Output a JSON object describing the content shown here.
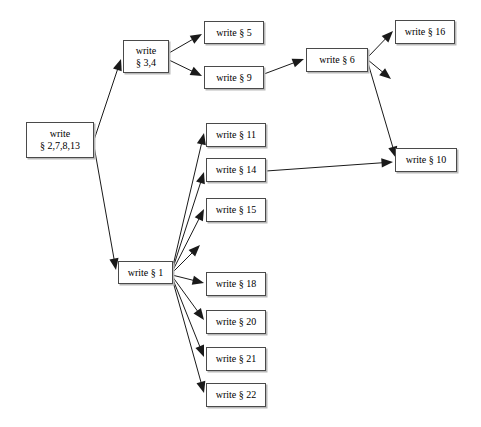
{
  "diagram": {
    "type": "directed-graph",
    "background_color": "#ffffff",
    "node_fill": "#ffffff",
    "node_border_color": "#4a4a4a",
    "node_shadow_color": "#b9b9b9",
    "edge_color": "#1a1a1a",
    "text_color": "#000000",
    "nodes": [
      {
        "id": "n_2_7_8_13",
        "lines": [
          "write",
          "§ 2,7,8,13"
        ],
        "label": "write § 2,7,8,13",
        "x": 26,
        "y": 122,
        "w": 68,
        "h": 36
      },
      {
        "id": "n_3_4",
        "lines": [
          "write",
          "§ 3,4"
        ],
        "label": "write § 3,4",
        "x": 123,
        "y": 40,
        "w": 46,
        "h": 33
      },
      {
        "id": "n_5",
        "lines": [
          "write § 5"
        ],
        "label": "write § 5",
        "x": 204,
        "y": 21,
        "w": 60,
        "h": 23
      },
      {
        "id": "n_9",
        "lines": [
          "write § 9"
        ],
        "label": "write § 9",
        "x": 204,
        "y": 66,
        "w": 60,
        "h": 23
      },
      {
        "id": "n_6",
        "lines": [
          "write § 6"
        ],
        "label": "write § 6",
        "x": 306,
        "y": 48,
        "w": 62,
        "h": 24
      },
      {
        "id": "n_16",
        "lines": [
          "write § 16"
        ],
        "label": "write § 16",
        "x": 395,
        "y": 20,
        "w": 60,
        "h": 24
      },
      {
        "id": "n_10",
        "lines": [
          "write § 10"
        ],
        "label": "write § 10",
        "x": 395,
        "y": 148,
        "w": 62,
        "h": 24
      },
      {
        "id": "n_11",
        "lines": [
          "write § 11"
        ],
        "label": "write § 11",
        "x": 206,
        "y": 123,
        "w": 60,
        "h": 24
      },
      {
        "id": "n_14",
        "lines": [
          "write § 14"
        ],
        "label": "write § 14",
        "x": 206,
        "y": 158,
        "w": 60,
        "h": 24
      },
      {
        "id": "n_15",
        "lines": [
          "write § 15"
        ],
        "label": "write § 15",
        "x": 206,
        "y": 198,
        "w": 60,
        "h": 24
      },
      {
        "id": "n_hub",
        "lines": [
          "write § 1"
        ],
        "label": "write § 1",
        "x": 118,
        "y": 261,
        "w": 55,
        "h": 23
      },
      {
        "id": "n_18",
        "lines": [
          "write § 18"
        ],
        "label": "write § 18",
        "x": 206,
        "y": 272,
        "w": 60,
        "h": 24
      },
      {
        "id": "n_20",
        "lines": [
          "write § 20"
        ],
        "label": "write § 20",
        "x": 206,
        "y": 310,
        "w": 60,
        "h": 24
      },
      {
        "id": "n_21",
        "lines": [
          "write § 21"
        ],
        "label": "write § 21",
        "x": 206,
        "y": 347,
        "w": 60,
        "h": 24
      },
      {
        "id": "n_22",
        "lines": [
          "write § 22"
        ],
        "label": "write § 22",
        "x": 206,
        "y": 383,
        "w": 60,
        "h": 24
      }
    ],
    "edges": [
      {
        "from": "n_2_7_8_13",
        "to": "n_3_4",
        "x1": 94,
        "y1": 140,
        "x2": 121,
        "y2": 59
      },
      {
        "from": "n_2_7_8_13",
        "to": "n_hub",
        "x1": 94,
        "y1": 146,
        "x2": 116,
        "y2": 270
      },
      {
        "from": "n_3_4",
        "to": "n_5",
        "x1": 169,
        "y1": 53,
        "x2": 202,
        "y2": 34
      },
      {
        "from": "n_3_4",
        "to": "n_9",
        "x1": 169,
        "y1": 60,
        "x2": 202,
        "y2": 76
      },
      {
        "from": "n_9",
        "to": "n_6",
        "x1": 264,
        "y1": 74,
        "x2": 304,
        "y2": 59
      },
      {
        "from": "n_6",
        "to": "n_16",
        "x1": 368,
        "y1": 57,
        "x2": 393,
        "y2": 31
      },
      {
        "from": "n_6",
        "to": "n_dangling_a",
        "x1": 368,
        "y1": 60,
        "x2": 391,
        "y2": 79,
        "dangling": true
      },
      {
        "from": "n_6",
        "to": "n_10",
        "x1": 368,
        "y1": 63,
        "x2": 396,
        "y2": 158
      },
      {
        "from": "n_14",
        "to": "n_10",
        "x1": 266,
        "y1": 171,
        "x2": 393,
        "y2": 162
      },
      {
        "from": "n_hub",
        "to": "n_11",
        "x1": 172,
        "y1": 270,
        "x2": 204,
        "y2": 133
      },
      {
        "from": "n_hub",
        "to": "n_14",
        "x1": 172,
        "y1": 271,
        "x2": 204,
        "y2": 172
      },
      {
        "from": "n_hub",
        "to": "n_15",
        "x1": 172,
        "y1": 272,
        "x2": 204,
        "y2": 209
      },
      {
        "from": "n_hub",
        "to": "n_dangling_b",
        "x1": 172,
        "y1": 273,
        "x2": 200,
        "y2": 245,
        "dangling": true
      },
      {
        "from": "n_hub",
        "to": "n_18",
        "x1": 172,
        "y1": 275,
        "x2": 204,
        "y2": 283
      },
      {
        "from": "n_hub",
        "to": "n_20",
        "x1": 172,
        "y1": 276,
        "x2": 204,
        "y2": 320
      },
      {
        "from": "n_hub",
        "to": "n_21",
        "x1": 172,
        "y1": 277,
        "x2": 204,
        "y2": 357
      },
      {
        "from": "n_hub",
        "to": "n_22",
        "x1": 172,
        "y1": 278,
        "x2": 204,
        "y2": 393
      }
    ]
  }
}
